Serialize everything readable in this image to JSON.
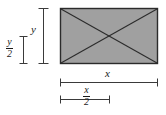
{
  "figure": {
    "type": "geometry-diagram",
    "shape": {
      "name": "rectangle-with-diagonals",
      "fill_color": "#a0a0a0",
      "stroke_color": "#2b2b2b",
      "diagonals": 2
    },
    "labels": {
      "height_full": "y",
      "height_half_numerator": "y",
      "height_half_denominator": "2",
      "width_full": "x",
      "width_half_numerator": "x",
      "width_half_denominator": "2"
    },
    "dimension_bars": [
      {
        "name": "height-full-bar",
        "orientation": "vertical",
        "label": "y",
        "measures": "full height of rectangle"
      },
      {
        "name": "height-half-bar",
        "orientation": "vertical",
        "label": "y/2",
        "measures": "half the height of rectangle"
      },
      {
        "name": "width-full-bar",
        "orientation": "horizontal",
        "label": "x",
        "measures": "full width of rectangle"
      },
      {
        "name": "width-half-bar",
        "orientation": "horizontal",
        "label": "x/2",
        "measures": "half the width of rectangle"
      }
    ],
    "colors": {
      "line": "#2b2b2b",
      "fill": "#a0a0a0",
      "background": "#ffffff",
      "text": "#1a1a1a"
    }
  }
}
